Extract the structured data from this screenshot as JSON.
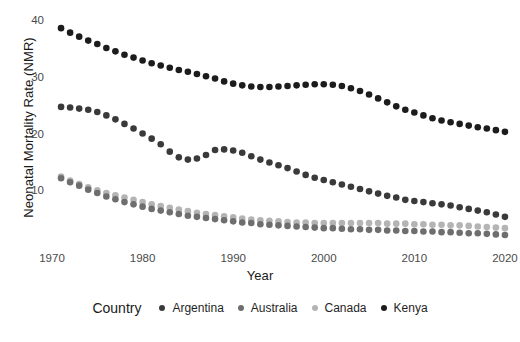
{
  "chart_data": {
    "type": "scatter",
    "title": "",
    "xlabel": "Year",
    "ylabel": "Neonatal Mortality Rate (NMR)",
    "xlim": [
      1970,
      2021
    ],
    "ylim": [
      0,
      42
    ],
    "grid": false,
    "legend_position": "bottom",
    "legend_title": "Country",
    "x_ticks": [
      "1970",
      "1980",
      "1990",
      "2000",
      "2010",
      "2020"
    ],
    "x_tick_values": [
      1970,
      1980,
      1990,
      2000,
      2010,
      2020
    ],
    "y_ticks": [
      "10",
      "20",
      "30",
      "40"
    ],
    "y_tick_values": [
      10,
      20,
      30,
      40
    ],
    "x": [
      1971,
      1972,
      1973,
      1974,
      1975,
      1976,
      1977,
      1978,
      1979,
      1980,
      1981,
      1982,
      1983,
      1984,
      1985,
      1986,
      1987,
      1988,
      1989,
      1990,
      1991,
      1992,
      1993,
      1994,
      1995,
      1996,
      1997,
      1998,
      1999,
      2000,
      2001,
      2002,
      2003,
      2004,
      2005,
      2006,
      2007,
      2008,
      2009,
      2010,
      2011,
      2012,
      2013,
      2014,
      2015,
      2016,
      2017,
      2018,
      2019,
      2020
    ],
    "series": [
      {
        "name": "Kenya",
        "color": "#1c1c1c",
        "values": [
          38.8,
          38.0,
          37.3,
          36.6,
          36.0,
          35.3,
          34.7,
          34.1,
          33.6,
          33.1,
          32.6,
          32.2,
          31.8,
          31.4,
          31.1,
          30.7,
          30.3,
          29.9,
          29.4,
          29.0,
          28.7,
          28.5,
          28.4,
          28.4,
          28.5,
          28.6,
          28.7,
          28.8,
          28.9,
          28.9,
          28.8,
          28.6,
          28.2,
          27.7,
          27.1,
          26.4,
          25.7,
          25.0,
          24.4,
          23.9,
          23.4,
          22.9,
          22.5,
          22.2,
          21.9,
          21.6,
          21.3,
          21.1,
          20.8,
          20.5
        ]
      },
      {
        "name": "Argentina",
        "color": "#3a3a3a",
        "values": [
          24.9,
          24.8,
          24.6,
          24.4,
          24.0,
          23.4,
          22.7,
          21.9,
          21.1,
          20.2,
          19.3,
          18.3,
          17.0,
          16.0,
          15.6,
          15.8,
          16.4,
          17.3,
          17.4,
          17.2,
          16.8,
          16.2,
          15.6,
          15.1,
          14.6,
          14.1,
          13.5,
          12.9,
          12.4,
          12.0,
          11.6,
          11.2,
          10.8,
          10.4,
          10.0,
          9.6,
          9.2,
          8.9,
          8.5,
          8.3,
          8.1,
          7.9,
          7.7,
          7.5,
          7.2,
          6.9,
          6.6,
          6.3,
          5.9,
          5.5
        ]
      },
      {
        "name": "Canada",
        "color": "#b4b4b4",
        "values": [
          12.6,
          11.9,
          11.3,
          10.7,
          10.2,
          9.7,
          9.3,
          8.9,
          8.5,
          8.1,
          7.7,
          7.4,
          7.1,
          6.8,
          6.5,
          6.2,
          6.0,
          5.8,
          5.6,
          5.4,
          5.2,
          5.0,
          4.9,
          4.8,
          4.7,
          4.6,
          4.5,
          4.5,
          4.4,
          4.4,
          4.4,
          4.4,
          4.4,
          4.4,
          4.4,
          4.4,
          4.3,
          4.3,
          4.3,
          4.2,
          4.2,
          4.1,
          4.1,
          4.0,
          4.0,
          3.9,
          3.8,
          3.7,
          3.6,
          3.5
        ]
      },
      {
        "name": "Australia",
        "color": "#6e6e6e",
        "values": [
          12.3,
          11.6,
          11.0,
          10.3,
          9.7,
          9.1,
          8.6,
          8.1,
          7.7,
          7.3,
          6.9,
          6.6,
          6.3,
          6.0,
          5.7,
          5.5,
          5.3,
          5.1,
          4.9,
          4.7,
          4.5,
          4.4,
          4.2,
          4.1,
          4.0,
          3.9,
          3.8,
          3.7,
          3.6,
          3.5,
          3.5,
          3.4,
          3.3,
          3.3,
          3.2,
          3.2,
          3.1,
          3.1,
          3.0,
          3.0,
          2.9,
          2.9,
          2.8,
          2.8,
          2.7,
          2.6,
          2.6,
          2.5,
          2.4,
          2.3
        ]
      }
    ]
  },
  "legend": {
    "title": "Country",
    "items": [
      {
        "label": "Argentina",
        "color": "#3a3a3a"
      },
      {
        "label": "Australia",
        "color": "#6e6e6e"
      },
      {
        "label": "Canada",
        "color": "#b4b4b4"
      },
      {
        "label": "Kenya",
        "color": "#1c1c1c"
      }
    ]
  },
  "axes": {
    "x_title": "Year",
    "y_title": "Neonatal Mortality Rate (NMR)",
    "x_tick_labels": [
      "1970",
      "1980",
      "1990",
      "2000",
      "2010",
      "2020"
    ],
    "y_tick_labels": [
      "40",
      "30",
      "20",
      "10"
    ]
  }
}
